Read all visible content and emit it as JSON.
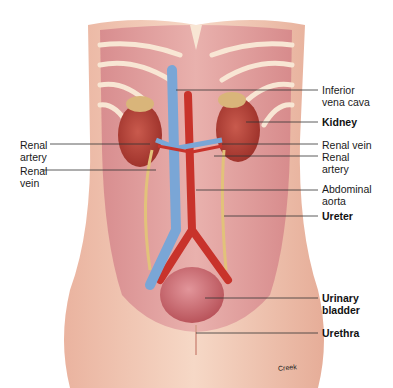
{
  "figure": {
    "credit": "Creek"
  },
  "labels": {
    "right_side": [
      {
        "id": "inferior-vena-cava",
        "text": [
          "Inferior",
          "vena cava"
        ],
        "bold": false
      },
      {
        "id": "kidney",
        "text": [
          "Kidney"
        ],
        "bold": true
      },
      {
        "id": "renal-vein-right",
        "text": [
          "Renal vein"
        ],
        "bold": false
      },
      {
        "id": "renal-artery-right",
        "text": [
          "Renal",
          "artery"
        ],
        "bold": false
      },
      {
        "id": "abdominal-aorta",
        "text": [
          "Abdominal",
          "aorta"
        ],
        "bold": false
      },
      {
        "id": "ureter",
        "text": [
          "Ureter"
        ],
        "bold": true
      },
      {
        "id": "urinary-bladder",
        "text": [
          "Urinary",
          "bladder"
        ],
        "bold": true
      },
      {
        "id": "urethra",
        "text": [
          "Urethra"
        ],
        "bold": true
      }
    ],
    "left_side": [
      {
        "id": "renal-artery-left",
        "text": [
          "Renal",
          "artery"
        ],
        "bold": false
      },
      {
        "id": "renal-vein-left",
        "text": [
          "Renal",
          "vein"
        ],
        "bold": false
      }
    ]
  },
  "colors": {
    "skin": "#f3cdb8",
    "muscle": "#d98f8f",
    "kidney": "#b8443a",
    "vein": "#7aa6d6",
    "artery": "#c8332b",
    "ureter": "#e2c27a",
    "bladder": "#c9686d",
    "rib": "#f7e3cf"
  }
}
